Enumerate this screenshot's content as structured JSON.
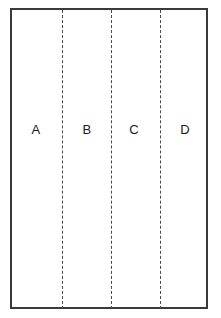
{
  "figure": {
    "background_color": "#ffffff",
    "border_color": "#3a3a3a",
    "divider_color": "#4a4a4a",
    "label_color": "#1a1a1a"
  },
  "regions": [
    {
      "label": "A",
      "left": 26
    },
    {
      "label": "B",
      "left": 77
    },
    {
      "label": "C",
      "left": 124
    },
    {
      "label": "D",
      "left": 175
    }
  ],
  "dividers": [
    {
      "name": "divider-ab",
      "left": 62
    },
    {
      "name": "divider-bc",
      "left": 111
    },
    {
      "name": "divider-cd",
      "left": 160
    }
  ]
}
